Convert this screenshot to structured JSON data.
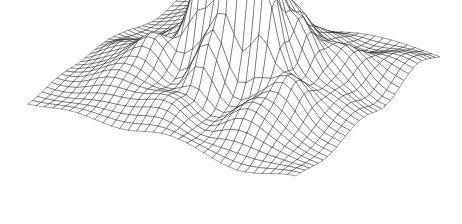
{
  "figure": {
    "title": "",
    "caption": "",
    "background_color": "#ffffff",
    "line_color": "#1a1a1a",
    "face_color": "#ffffff",
    "line_width": 0.42,
    "width_px": 462,
    "height_px": 224
  },
  "chart_data": {
    "type": "surface",
    "render": "wireframe-mesh",
    "title": "",
    "subtitle": "",
    "xlabel": "",
    "ylabel": "",
    "zlabel": "",
    "grid": true,
    "legend": false,
    "axes_visible": false,
    "tick_labels": [],
    "annotations": [],
    "hidden_line_removal": true,
    "grid_divisions_u": 32,
    "grid_divisions_v": 32,
    "domain": {
      "u": [
        -1,
        1
      ],
      "v": [
        -1,
        1
      ]
    },
    "zlim": [
      0,
      1
    ],
    "projection": {
      "type": "oblique-parallel",
      "corner_left_px": [
        28,
        118
      ],
      "corner_back_px": [
        181,
        16
      ],
      "corner_right_px": [
        440,
        74
      ],
      "corner_front_px": [
        296,
        199
      ],
      "z_scale_px": 150
    },
    "surface_model": {
      "description": "Sum of radial Gaussian bumps plus a low-amplitude ripple field, producing a rolling terrain with a cluster of tall sharp peaks near the centre-back.",
      "base_level": 0.12,
      "ripple": {
        "amplitude": 0.055,
        "freq_u": 7.4,
        "freq_v": 6.8,
        "phase_u": 0.45,
        "phase_v": 1.15,
        "cross_amplitude": 0.035,
        "cross_freq": 4.6
      },
      "edge_falloff": 2.4,
      "bumps": [
        {
          "u": 0.07,
          "v": -0.12,
          "amp": 0.98,
          "sigma": 0.085
        },
        {
          "u": 0.2,
          "v": -0.02,
          "amp": 0.92,
          "sigma": 0.08
        },
        {
          "u": -0.05,
          "v": 0.02,
          "amp": 0.8,
          "sigma": 0.09
        },
        {
          "u": 0.32,
          "v": -0.16,
          "amp": 0.74,
          "sigma": 0.085
        },
        {
          "u": -0.18,
          "v": -0.1,
          "amp": 0.7,
          "sigma": 0.095
        },
        {
          "u": 0.13,
          "v": 0.16,
          "amp": 0.62,
          "sigma": 0.1
        },
        {
          "u": -0.3,
          "v": 0.06,
          "amp": 0.52,
          "sigma": 0.11
        },
        {
          "u": 0.42,
          "v": 0.08,
          "amp": 0.48,
          "sigma": 0.115
        },
        {
          "u": -0.02,
          "v": -0.34,
          "amp": 0.46,
          "sigma": 0.105
        },
        {
          "u": 0.26,
          "v": 0.34,
          "amp": 0.4,
          "sigma": 0.125
        },
        {
          "u": -0.44,
          "v": -0.26,
          "amp": 0.36,
          "sigma": 0.135
        },
        {
          "u": 0.58,
          "v": -0.3,
          "amp": 0.34,
          "sigma": 0.13
        },
        {
          "u": -0.24,
          "v": 0.4,
          "amp": 0.32,
          "sigma": 0.14
        },
        {
          "u": 0.05,
          "v": 0.52,
          "amp": 0.3,
          "sigma": 0.145
        },
        {
          "u": 0.62,
          "v": 0.36,
          "amp": 0.26,
          "sigma": 0.15
        },
        {
          "u": -0.58,
          "v": 0.3,
          "amp": 0.24,
          "sigma": 0.155
        },
        {
          "u": -0.62,
          "v": -0.56,
          "amp": 0.2,
          "sigma": 0.165
        },
        {
          "u": 0.4,
          "v": -0.6,
          "amp": 0.22,
          "sigma": 0.15
        },
        {
          "u": 0.74,
          "v": -0.02,
          "amp": 0.18,
          "sigma": 0.16
        },
        {
          "u": -0.06,
          "v": -0.7,
          "amp": 0.18,
          "sigma": 0.155
        },
        {
          "u": 0.34,
          "v": 0.68,
          "amp": 0.16,
          "sigma": 0.17
        },
        {
          "u": -0.4,
          "v": 0.7,
          "amp": 0.15,
          "sigma": 0.17
        },
        {
          "u": 0.78,
          "v": 0.64,
          "amp": 0.12,
          "sigma": 0.18
        },
        {
          "u": -0.78,
          "v": -0.06,
          "amp": 0.13,
          "sigma": 0.175
        }
      ]
    }
  }
}
